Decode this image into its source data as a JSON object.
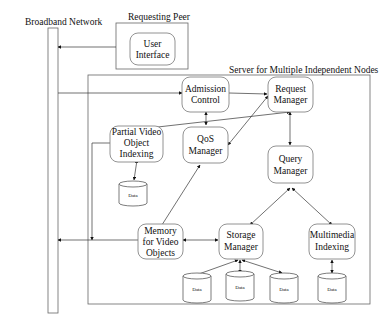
{
  "labels": {
    "broadband_network": "Broadband Network",
    "requesting_peer": "Requesting Peer",
    "server": "Server for Multiple Independent Nodes"
  },
  "nodes": {
    "user_interface": [
      "User",
      "Interface"
    ],
    "admission_control": [
      "Admission",
      "Control"
    ],
    "request_manager": [
      "Request",
      "Manager"
    ],
    "partial_video": [
      "Partial Video",
      "Object",
      "Indexing"
    ],
    "qos_manager": [
      "QoS",
      "Manager"
    ],
    "query_manager": [
      "Query",
      "Manager"
    ],
    "memory": [
      "Memory",
      "for Video",
      "Objects"
    ],
    "storage_manager": [
      "Storage",
      "Manager"
    ],
    "multimedia_indexing": [
      "Multimedia",
      "Indexing"
    ]
  },
  "data_stores": {
    "label": "Data",
    "count": 5
  },
  "colors": {
    "line": "#333333",
    "box_border": "#777777",
    "background": "#ffffff"
  }
}
